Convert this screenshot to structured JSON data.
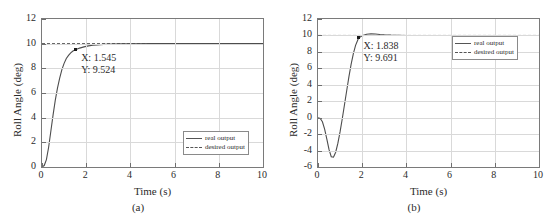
{
  "figure": {
    "panels": [
      {
        "caption": "(a)",
        "axis": {
          "xlabel": "Time (s)",
          "ylabel": "Roll Angle (deg)",
          "xticks": [
            "0",
            "2",
            "4",
            "6",
            "8",
            "10"
          ],
          "yticks": [
            "0",
            "2",
            "4",
            "6",
            "8",
            "10",
            "12"
          ],
          "xlim": [
            0,
            10
          ],
          "ylim": [
            0,
            12
          ]
        },
        "datatip": {
          "x_label": "X: 1.545",
          "y_label": "Y: 9.524",
          "x": 1.545,
          "y": 9.524
        },
        "legend": {
          "position": "bottom-right",
          "items": [
            {
              "label": "real output",
              "style": "solid"
            },
            {
              "label": "desired output",
              "style": "dashed"
            }
          ]
        }
      },
      {
        "caption": "(b)",
        "axis": {
          "xlabel": "Time (s)",
          "ylabel": "Roll Angle (deg)",
          "xticks": [
            "0",
            "2",
            "4",
            "6",
            "8",
            "10"
          ],
          "yticks": [
            "-6",
            "-4",
            "-2",
            "0",
            "2",
            "4",
            "6",
            "8",
            "10",
            "12"
          ],
          "xlim": [
            0,
            10
          ],
          "ylim": [
            -6,
            12
          ]
        },
        "datatip": {
          "x_label": "X: 1.838",
          "y_label": "Y: 9.691",
          "x": 1.838,
          "y": 9.691
        },
        "legend": {
          "position": "top-right",
          "items": [
            {
              "label": "real output",
              "style": "solid"
            },
            {
              "label": "desired output",
              "style": "dashed"
            }
          ]
        }
      }
    ]
  },
  "chart_data": [
    {
      "type": "line",
      "title": "",
      "xlabel": "Time (s)",
      "ylabel": "Roll Angle (deg)",
      "xlim": [
        0,
        10
      ],
      "ylim": [
        0,
        12
      ],
      "grid": true,
      "legend_position": "lower right",
      "annotations": [
        {
          "text": "X: 1.545\nY: 9.524",
          "x": 1.545,
          "y": 9.524
        }
      ],
      "series": [
        {
          "name": "real output",
          "style": "solid",
          "color": "#4d4d4d",
          "x": [
            0,
            0.1,
            0.2,
            0.3,
            0.4,
            0.5,
            0.6,
            0.7,
            0.8,
            0.9,
            1.0,
            1.1,
            1.2,
            1.3,
            1.4,
            1.545,
            1.7,
            1.9,
            2.1,
            2.3,
            2.5,
            2.8,
            3.2,
            3.6,
            4.0,
            5.0,
            6.0,
            7.0,
            8.0,
            9.0,
            10.0
          ],
          "y": [
            0,
            0.12,
            0.6,
            1.6,
            2.9,
            4.2,
            5.4,
            6.4,
            7.2,
            7.9,
            8.4,
            8.8,
            9.05,
            9.25,
            9.4,
            9.524,
            9.64,
            9.74,
            9.82,
            9.87,
            9.9,
            9.94,
            9.97,
            9.98,
            9.99,
            10.0,
            10.0,
            10.0,
            10.0,
            10.0,
            10.0
          ]
        },
        {
          "name": "desired output",
          "style": "dashed",
          "color": "#4d4d4d",
          "x": [
            0,
            10
          ],
          "y": [
            10,
            10
          ]
        }
      ]
    },
    {
      "type": "line",
      "title": "",
      "xlabel": "Time (s)",
      "ylabel": "Roll Angle (deg)",
      "xlim": [
        0,
        10
      ],
      "ylim": [
        -6,
        12
      ],
      "grid": true,
      "legend_position": "upper right",
      "annotations": [
        {
          "text": "X: 1.838\nY: 9.691",
          "x": 1.838,
          "y": 9.691
        }
      ],
      "series": [
        {
          "name": "real output",
          "style": "solid",
          "color": "#4d4d4d",
          "x": [
            0,
            0.1,
            0.2,
            0.3,
            0.4,
            0.5,
            0.6,
            0.7,
            0.8,
            0.9,
            1.0,
            1.1,
            1.2,
            1.3,
            1.4,
            1.5,
            1.6,
            1.7,
            1.838,
            2.0,
            2.2,
            2.4,
            2.6,
            2.8,
            3.0,
            3.3,
            3.6,
            4.0,
            4.5,
            5.0,
            6.0,
            7.0,
            8.0,
            9.0,
            10.0
          ],
          "y": [
            0,
            -0.1,
            -0.5,
            -1.4,
            -2.6,
            -3.9,
            -4.75,
            -4.8,
            -4.2,
            -3.1,
            -1.7,
            -0.1,
            1.6,
            3.3,
            5.0,
            6.5,
            7.8,
            8.8,
            9.691,
            9.95,
            10.15,
            10.2,
            10.18,
            10.12,
            10.08,
            10.04,
            10.02,
            10.0,
            10.0,
            10.0,
            10.0,
            10.0,
            10.0,
            10.0,
            10.0
          ]
        },
        {
          "name": "desired output",
          "style": "dashed",
          "color": "#4d4d4d",
          "x": [
            0,
            10
          ],
          "y": [
            10,
            10
          ]
        }
      ]
    }
  ]
}
